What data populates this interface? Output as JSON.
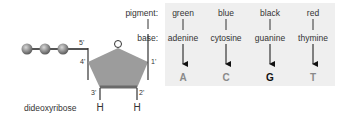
{
  "molecule": {
    "sugar_label": "dideoxyribose",
    "ring_oxygen": "O",
    "positions": {
      "p5": "5'",
      "p4": "4'",
      "p3": "3'",
      "p2": "2'",
      "p1": "1'"
    },
    "hydrogens": [
      "H",
      "H"
    ],
    "phosphate_count": 3
  },
  "legend": {
    "pigment_label": "pigment:",
    "base_label": "base:"
  },
  "columns": [
    {
      "pigment": "green",
      "base": "adenine",
      "letter": "A",
      "letter_color": "#8a8a8a"
    },
    {
      "pigment": "blue",
      "base": "cytosine",
      "letter": "C",
      "letter_color": "#8a8a8a"
    },
    {
      "pigment": "black",
      "base": "guanine",
      "letter": "G",
      "letter_color": "#111111"
    },
    {
      "pigment": "red",
      "base": "thymine",
      "letter": "T",
      "letter_color": "#8a8a8a"
    }
  ],
  "colors": {
    "panel_bg": "#efefef",
    "pentagon_fill": "#9a9a9a",
    "pentagon_bottom": "#6e6e6e",
    "ball": "#8c8c8c",
    "line": "#333333"
  }
}
